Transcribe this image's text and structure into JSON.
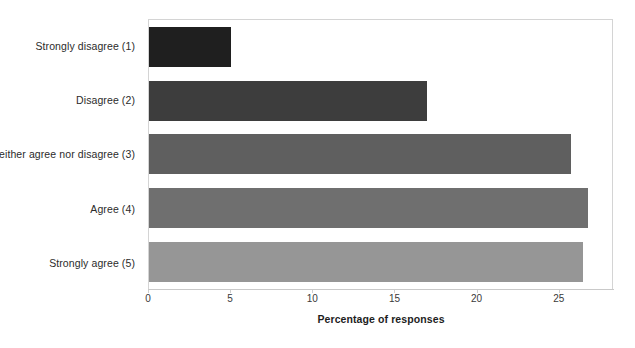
{
  "chart_data": {
    "type": "bar",
    "orientation": "horizontal",
    "title": "",
    "xlabel": "Percentage of responses",
    "ylabel": "",
    "xlim": [
      0,
      28.3
    ],
    "grid": false,
    "legend": false,
    "xticks": [
      0,
      5,
      10,
      15,
      20,
      25
    ],
    "xtick_labels": [
      "0",
      "5",
      "10",
      "15",
      "20",
      "25"
    ],
    "categories": [
      "Strongly disagree (1)",
      "Disagree (2)",
      "Neither agree nor disagree (3)",
      "Agree (4)",
      "Strongly agree (5)"
    ],
    "values": [
      5.0,
      16.9,
      25.7,
      26.7,
      26.4
    ],
    "bar_colors": [
      "#1f1f1f",
      "#3d3d3d",
      "#5f5f5f",
      "#6f6f6f",
      "#969696"
    ]
  },
  "axis": {
    "x_title": "Percentage of responses"
  }
}
